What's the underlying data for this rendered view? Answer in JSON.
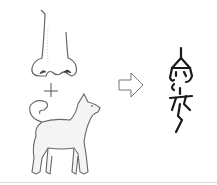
{
  "diagram": {
    "components": [
      {
        "name": "nose",
        "icon": "nose-illustration"
      },
      {
        "name": "dog",
        "icon": "dog-illustration"
      }
    ],
    "operator": "+",
    "result_arrow": "arrow-right-outline",
    "result": {
      "name": "ancient-character",
      "icon": "oracle-bone-glyph"
    },
    "colors": {
      "line": "#555555",
      "glyph": "#1a1a1a",
      "background": "#ffffff"
    }
  }
}
